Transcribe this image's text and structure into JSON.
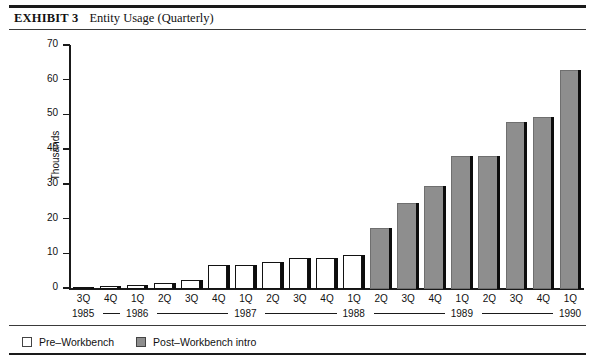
{
  "exhibit": {
    "label": "EXHIBIT 3",
    "title": "Entity Usage (Quarterly)"
  },
  "chart_data": {
    "type": "bar",
    "title": "Entity Usage (Quarterly)",
    "xlabel": "",
    "ylabel": "Thousands",
    "ylim": [
      0,
      70
    ],
    "yticks": [
      0,
      10,
      20,
      30,
      40,
      50,
      60,
      70
    ],
    "grid": false,
    "legend_position": "bottom-left",
    "categories": [
      "3Q",
      "4Q",
      "1Q",
      "2Q",
      "3Q",
      "4Q",
      "1Q",
      "2Q",
      "3Q",
      "4Q",
      "1Q",
      "2Q",
      "3Q",
      "4Q",
      "1Q",
      "2Q",
      "3Q",
      "4Q",
      "1Q"
    ],
    "years": [
      "1985",
      "1985",
      "1986",
      "1986",
      "1986",
      "1986",
      "1987",
      "1987",
      "1987",
      "1987",
      "1988",
      "1988",
      "1988",
      "1988",
      "1989",
      "1989",
      "1989",
      "1989",
      "1990"
    ],
    "values": [
      0.5,
      0.8,
      1.3,
      1.8,
      2.5,
      7.0,
      7.0,
      7.8,
      8.8,
      8.8,
      9.8,
      17.5,
      24.7,
      29.8,
      38.2,
      38.2,
      48.0,
      49.6,
      63.0
    ],
    "series": [
      {
        "name": "Pre-Workbench",
        "color": "#ffffff",
        "values": [
          0.5,
          0.8,
          1.3,
          1.8,
          2.5,
          7.0,
          7.0,
          7.8,
          8.8,
          8.8,
          9.8,
          null,
          null,
          null,
          null,
          null,
          null,
          null,
          null
        ]
      },
      {
        "name": "Post-Workbench intro",
        "color": "#8e8e8e",
        "values": [
          null,
          null,
          null,
          null,
          null,
          null,
          null,
          null,
          null,
          null,
          null,
          17.5,
          24.7,
          29.8,
          38.2,
          38.2,
          48.0,
          49.6,
          63.0
        ]
      }
    ]
  },
  "bars": [
    {
      "q": "3Q",
      "year": "1985",
      "value": 0.5,
      "series": "pre"
    },
    {
      "q": "4Q",
      "year": "1985",
      "value": 0.8,
      "series": "pre"
    },
    {
      "q": "1Q",
      "year": "1986",
      "value": 1.3,
      "series": "pre"
    },
    {
      "q": "2Q",
      "year": "1986",
      "value": 1.8,
      "series": "pre"
    },
    {
      "q": "3Q",
      "year": "1986",
      "value": 2.5,
      "series": "pre"
    },
    {
      "q": "4Q",
      "year": "1986",
      "value": 7.0,
      "series": "pre"
    },
    {
      "q": "1Q",
      "year": "1987",
      "value": 7.0,
      "series": "pre"
    },
    {
      "q": "2Q",
      "year": "1987",
      "value": 7.8,
      "series": "pre"
    },
    {
      "q": "3Q",
      "year": "1987",
      "value": 8.8,
      "series": "pre"
    },
    {
      "q": "4Q",
      "year": "1987",
      "value": 8.8,
      "series": "pre"
    },
    {
      "q": "1Q",
      "year": "1988",
      "value": 9.8,
      "series": "pre"
    },
    {
      "q": "2Q",
      "year": "1988",
      "value": 17.5,
      "series": "post"
    },
    {
      "q": "3Q",
      "year": "1988",
      "value": 24.7,
      "series": "post"
    },
    {
      "q": "4Q",
      "year": "1988",
      "value": 29.8,
      "series": "post"
    },
    {
      "q": "1Q",
      "year": "1989",
      "value": 38.2,
      "series": "post"
    },
    {
      "q": "2Q",
      "year": "1989",
      "value": 38.2,
      "series": "post"
    },
    {
      "q": "3Q",
      "year": "1989",
      "value": 48.0,
      "series": "post"
    },
    {
      "q": "4Q",
      "year": "1989",
      "value": 49.6,
      "series": "post"
    },
    {
      "q": "1Q",
      "year": "1990",
      "value": 63.0,
      "series": "post"
    }
  ],
  "year_groups": [
    {
      "label": "1985",
      "start": 0,
      "span": 2
    },
    {
      "label": "1986",
      "start": 2,
      "span": 4
    },
    {
      "label": "1987",
      "start": 6,
      "span": 4
    },
    {
      "label": "1988",
      "start": 10,
      "span": 4
    },
    {
      "label": "1989",
      "start": 14,
      "span": 4
    },
    {
      "label": "1990",
      "start": 18,
      "span": 1
    }
  ],
  "legend": {
    "items": [
      {
        "label": "Pre–Workbench",
        "swatch": "pre"
      },
      {
        "label": "Post–Workbench intro",
        "swatch": "post"
      }
    ]
  },
  "colors": {
    "pre_fill": "#ffffff",
    "post_fill": "#8e8e8e",
    "ink": "#111111",
    "shadow": "#0d0d0d"
  }
}
